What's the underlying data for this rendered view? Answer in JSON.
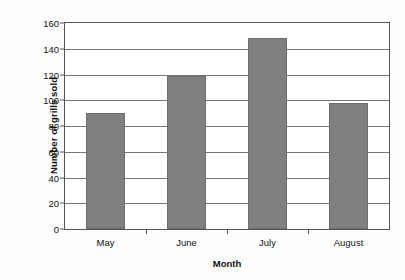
{
  "chart_data": {
    "type": "bar",
    "title": "",
    "categories": [
      "May",
      "June",
      "July",
      "August"
    ],
    "values": [
      90,
      119,
      148,
      98
    ],
    "series": [
      {
        "name": "Number of grills sold",
        "values": [
          90,
          119,
          148,
          98
        ]
      }
    ],
    "xlabel": "Month",
    "ylabel": "Number of grills sold",
    "ylim": [
      0,
      160
    ],
    "ytick_step": 20,
    "yticks": [
      0,
      20,
      40,
      60,
      80,
      100,
      120,
      140,
      160
    ],
    "ytick_labels": [
      "0",
      "20",
      "40",
      "60",
      "80",
      "100",
      "120",
      "140",
      "160"
    ],
    "grid": true,
    "grid_axis": "y",
    "legend": false,
    "legend_position": "none",
    "bar_color": "#808080",
    "axis_color": "#555555",
    "grid_color": "#777777",
    "background_color": "#ffffff"
  }
}
